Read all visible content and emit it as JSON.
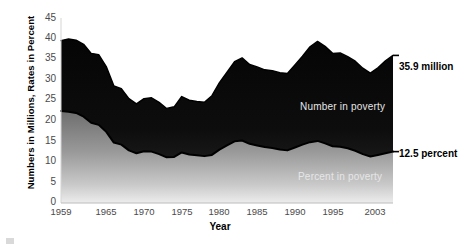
{
  "chart_data": {
    "type": "area",
    "title": "",
    "xlabel": "Year",
    "ylabel": "Numbers in Millions, Rates in Percent",
    "ylim": [
      0,
      45
    ],
    "xlim": [
      1959,
      2003
    ],
    "grid": false,
    "legend_position": "in-plot",
    "ytick_labels": [
      "45",
      "40",
      "35",
      "30",
      "25",
      "20",
      "15",
      "10",
      "5",
      "0"
    ],
    "ytick_values": [
      45,
      40,
      35,
      30,
      25,
      20,
      15,
      10,
      5,
      0
    ],
    "xtick_labels": [
      "1959",
      "1965",
      "1970",
      "1975",
      "1980",
      "1985",
      "1990",
      "1995",
      "2003"
    ],
    "xtick_values": [
      1959,
      1965,
      1970,
      1975,
      1980,
      1985,
      1990,
      1995,
      2003
    ],
    "x": [
      1959,
      1960,
      1961,
      1962,
      1963,
      1964,
      1965,
      1966,
      1967,
      1968,
      1969,
      1970,
      1971,
      1972,
      1973,
      1974,
      1975,
      1976,
      1977,
      1978,
      1979,
      1980,
      1981,
      1982,
      1983,
      1984,
      1985,
      1986,
      1987,
      1988,
      1989,
      1990,
      1991,
      1992,
      1993,
      1994,
      1995,
      1996,
      1997,
      1998,
      1999,
      2000,
      2001,
      2002,
      2003
    ],
    "series": [
      {
        "name": "Number in poverty",
        "units": "millions",
        "color": "#111111",
        "values": [
          39.5,
          39.9,
          39.6,
          38.6,
          36.4,
          36.1,
          33.2,
          28.5,
          27.8,
          25.4,
          24.1,
          25.4,
          25.6,
          24.5,
          23.0,
          23.4,
          25.9,
          25.0,
          24.7,
          24.5,
          26.1,
          29.3,
          31.8,
          34.4,
          35.3,
          33.7,
          33.1,
          32.4,
          32.2,
          31.7,
          31.5,
          33.6,
          35.7,
          38.0,
          39.3,
          38.1,
          36.4,
          36.5,
          35.6,
          34.5,
          32.8,
          31.6,
          32.9,
          34.6,
          35.9
        ],
        "label_end": "35.9 million"
      },
      {
        "name": "Percent in poverty",
        "units": "percent",
        "color": "#8b8b8b",
        "values": [
          22.4,
          22.2,
          21.9,
          21.0,
          19.5,
          19.0,
          17.3,
          14.7,
          14.2,
          12.8,
          12.1,
          12.6,
          12.5,
          11.9,
          11.1,
          11.2,
          12.3,
          11.8,
          11.6,
          11.4,
          11.7,
          13.0,
          14.0,
          15.0,
          15.2,
          14.4,
          14.0,
          13.6,
          13.4,
          13.0,
          12.8,
          13.5,
          14.2,
          14.8,
          15.1,
          14.5,
          13.8,
          13.7,
          13.3,
          12.7,
          11.9,
          11.3,
          11.7,
          12.1,
          12.5
        ],
        "label_end": "12.5 percent"
      }
    ],
    "annotations": [
      {
        "name": "number-in-poverty-inline-label",
        "text": "Number in poverty"
      },
      {
        "name": "percent-in-poverty-inline-label",
        "text": "Percent in poverty"
      },
      {
        "name": "number-end-callout",
        "text": "35.9 million"
      },
      {
        "name": "percent-end-callout",
        "text": "12.5 percent"
      }
    ]
  }
}
